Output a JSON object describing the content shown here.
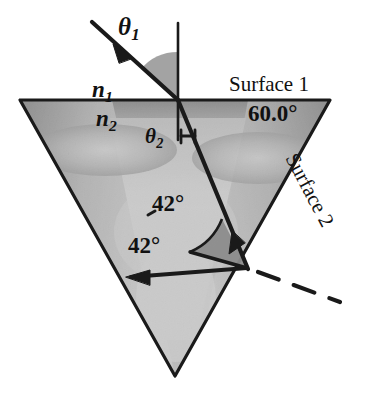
{
  "figure": {
    "name": "prism-total-internal-reflection-diagram",
    "background_color": "#ffffff",
    "line_color": "#1a1a1a",
    "prism_fill_light": "#e2e2e2",
    "prism_fill_mid": "#bdbdbd",
    "prism_fill_dark": "#8f8f8f",
    "arc_fill": "#9a9a9a"
  },
  "labels": {
    "theta1": "θ",
    "theta1_sub": "1",
    "theta2": "θ",
    "theta2_sub": "2",
    "n1": "n",
    "n1_sub": "1",
    "n2": "n",
    "n2_sub": "2",
    "surface1": "Surface 1",
    "surface2": "Surface 2",
    "apex_angle": "60.0°",
    "internal_angle_upper": "42°",
    "internal_angle_lower": "42°"
  },
  "geometry": {
    "prism_vertices": [
      [
        20,
        100
      ],
      [
        330,
        100
      ],
      [
        175,
        376
      ]
    ],
    "incidence_point": [
      178,
      100
    ],
    "reflection_point": [
      247,
      268
    ],
    "normal_line": [
      [
        178,
        23
      ],
      [
        178,
        140
      ]
    ],
    "incident_ray": [
      [
        92,
        22
      ],
      [
        178,
        100
      ]
    ],
    "refracted_ray": [
      [
        178,
        100
      ],
      [
        247,
        268
      ]
    ],
    "reflected_ray": [
      [
        247,
        268
      ],
      [
        128,
        277
      ]
    ],
    "dashed_ray": [
      [
        247,
        268
      ],
      [
        340,
        300
      ]
    ]
  }
}
